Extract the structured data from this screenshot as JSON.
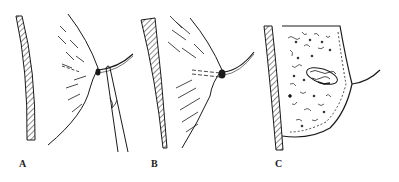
{
  "figure": {
    "panels": [
      {
        "id": "A",
        "label": "A",
        "label_pos": {
          "x": 19,
          "y": 158
        },
        "description": "chest wall with breast, nipple lesion held by forceps/clamp, suture loop"
      },
      {
        "id": "B",
        "label": "B",
        "label_pos": {
          "x": 151,
          "y": 158
        },
        "description": "chest wall with breast, nipple ligated with suture, dashed duct tract"
      },
      {
        "id": "C",
        "label": "C",
        "label_pos": {
          "x": 275,
          "y": 158
        },
        "description": "breast cross-section with glandular tissue, duct lesion, nipple with suture"
      }
    ],
    "colors": {
      "ink": "#1a1a1a",
      "background": "#ffffff"
    }
  }
}
